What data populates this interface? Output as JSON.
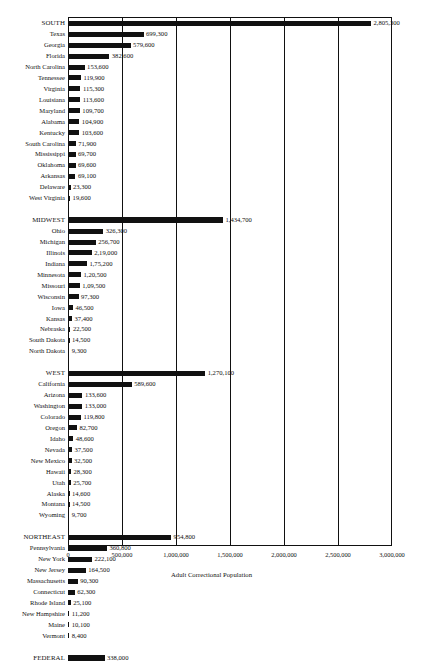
{
  "chart_data": {
    "type": "bar",
    "orientation": "horizontal",
    "title": "",
    "xlabel": "Adult Correctional Population",
    "ylabel": "",
    "xlim": [
      0,
      3000000
    ],
    "grid": true,
    "legend": null,
    "tick_labels": [
      "0",
      "500,000",
      "1,000,000",
      "1,500,000",
      "2,000,000",
      "2,500,000",
      "3,000,000"
    ],
    "tick_values": [
      0,
      500000,
      1000000,
      1500000,
      2000000,
      2500000,
      3000000
    ],
    "categories": [
      "SOUTH",
      "Texas",
      "Georgia",
      "Florida",
      "North Carolina",
      "Tennessee",
      "Virginia",
      "Louisiana",
      "Maryland",
      "Alabama",
      "Kentucky",
      "South Carolina",
      "Mississippi",
      "Oklahoma",
      "Arkansas",
      "Delaware",
      "West Virginia",
      "MIDWEST",
      "Ohio",
      "Michigan",
      "Illinois",
      "Indiana",
      "Minnesota",
      "Missouri",
      "Wisconsin",
      "Iowa",
      "Kansas",
      "Nebraska",
      "South Dakota",
      "North Dakota",
      "WEST",
      "California",
      "Arizona",
      "Washington",
      "Colorado",
      "Oregon",
      "Idaho",
      "Nevada",
      "New Mexico",
      "Hawaii",
      "Utah",
      "Alaska",
      "Montana",
      "Wyoming",
      "NORTHEAST",
      "Pennsylvania",
      "New York",
      "New Jersey",
      "Massachusetts",
      "Connecticut",
      "Rhode Island",
      "New Hampshire",
      "Maine",
      "Vermont",
      "FEDERAL"
    ],
    "values": [
      2805300,
      699300,
      579600,
      382600,
      153600,
      119900,
      115300,
      113600,
      109700,
      104900,
      103600,
      71900,
      69700,
      69600,
      69100,
      23300,
      19600,
      1434700,
      326300,
      256700,
      219000,
      175200,
      120500,
      109500,
      97300,
      46500,
      37400,
      22500,
      14500,
      9300,
      1270100,
      589600,
      133600,
      133000,
      119800,
      82700,
      48600,
      37500,
      32500,
      28300,
      25700,
      14600,
      14500,
      9700,
      954800,
      360800,
      222100,
      164500,
      90300,
      62300,
      25100,
      11200,
      10100,
      8400,
      338000
    ]
  },
  "rows": [
    {
      "label": "SOUTH",
      "value": 2805300,
      "value_label": "2,805,300",
      "region": true
    },
    {
      "label": "Texas",
      "value": 699300,
      "value_label": "699,300",
      "region": false
    },
    {
      "label": "Georgia",
      "value": 579600,
      "value_label": "579,600",
      "region": false
    },
    {
      "label": "Florida",
      "value": 382600,
      "value_label": "382,600",
      "region": false
    },
    {
      "label": "North Carolina",
      "value": 153600,
      "value_label": "153,600",
      "region": false
    },
    {
      "label": "Tennessee",
      "value": 119900,
      "value_label": "119,900",
      "region": false
    },
    {
      "label": "Virginia",
      "value": 115300,
      "value_label": "115,300",
      "region": false
    },
    {
      "label": "Louisiana",
      "value": 113600,
      "value_label": "113,600",
      "region": false
    },
    {
      "label": "Maryland",
      "value": 109700,
      "value_label": "109,700",
      "region": false
    },
    {
      "label": "Alabama",
      "value": 104900,
      "value_label": "104,900",
      "region": false
    },
    {
      "label": "Kentucky",
      "value": 103600,
      "value_label": "103,600",
      "region": false
    },
    {
      "label": "South Carolina",
      "value": 71900,
      "value_label": "71,900",
      "region": false
    },
    {
      "label": "Mississippi",
      "value": 69700,
      "value_label": "69,700",
      "region": false
    },
    {
      "label": "Oklahoma",
      "value": 69600,
      "value_label": "69,600",
      "region": false
    },
    {
      "label": "Arkansas",
      "value": 69100,
      "value_label": "69,100",
      "region": false
    },
    {
      "label": "Delaware",
      "value": 23300,
      "value_label": "23,300",
      "region": false
    },
    {
      "label": "West Virginia",
      "value": 19600,
      "value_label": "19,600",
      "region": false
    },
    {
      "spacer": true
    },
    {
      "label": "MIDWEST",
      "value": 1434700,
      "value_label": "1,434,700",
      "region": true
    },
    {
      "label": "Ohio",
      "value": 326300,
      "value_label": "326,300",
      "region": false
    },
    {
      "label": "Michigan",
      "value": 256700,
      "value_label": "256,700",
      "region": false
    },
    {
      "label": "Illinois",
      "value": 219000,
      "value_label": "2,19,000",
      "region": false
    },
    {
      "label": "Indiana",
      "value": 175200,
      "value_label": "1,75,200",
      "region": false
    },
    {
      "label": "Minnesota",
      "value": 120500,
      "value_label": "1,20,500",
      "region": false
    },
    {
      "label": "Missouri",
      "value": 109500,
      "value_label": "1,09,500",
      "region": false
    },
    {
      "label": "Wisconsin",
      "value": 97300,
      "value_label": "97,300",
      "region": false
    },
    {
      "label": "Iowa",
      "value": 46500,
      "value_label": "46,500",
      "region": false
    },
    {
      "label": "Kansas",
      "value": 37400,
      "value_label": "37,400",
      "region": false
    },
    {
      "label": "Nebraska",
      "value": 22500,
      "value_label": "22,500",
      "region": false
    },
    {
      "label": "South Dakota",
      "value": 14500,
      "value_label": "14,500",
      "region": false
    },
    {
      "label": "North Dakota",
      "value": 9300,
      "value_label": "9,300",
      "region": false
    },
    {
      "spacer": true
    },
    {
      "label": "WEST",
      "value": 1270100,
      "value_label": "1,270,100",
      "region": true
    },
    {
      "label": "California",
      "value": 589600,
      "value_label": "589,600",
      "region": false
    },
    {
      "label": "Arizona",
      "value": 133600,
      "value_label": "133,600",
      "region": false
    },
    {
      "label": "Washington",
      "value": 133000,
      "value_label": "133,000",
      "region": false
    },
    {
      "label": "Colorado",
      "value": 119800,
      "value_label": "119,800",
      "region": false
    },
    {
      "label": "Oregon",
      "value": 82700,
      "value_label": "82,700",
      "region": false
    },
    {
      "label": "Idaho",
      "value": 48600,
      "value_label": "48,600",
      "region": false
    },
    {
      "label": "Nevada",
      "value": 37500,
      "value_label": "37,500",
      "region": false
    },
    {
      "label": "New Mexico",
      "value": 32500,
      "value_label": "32,500",
      "region": false
    },
    {
      "label": "Hawaii",
      "value": 28300,
      "value_label": "28,300",
      "region": false
    },
    {
      "label": "Utah",
      "value": 25700,
      "value_label": "25,700",
      "region": false
    },
    {
      "label": "Alaska",
      "value": 14600,
      "value_label": "14,600",
      "region": false
    },
    {
      "label": "Montana",
      "value": 14500,
      "value_label": "14,500",
      "region": false
    },
    {
      "label": "Wyoming",
      "value": 9700,
      "value_label": "9,700",
      "region": false
    },
    {
      "spacer": true
    },
    {
      "label": "NORTHEAST",
      "value": 954800,
      "value_label": "954,800",
      "region": true
    },
    {
      "label": "Pennsylvania",
      "value": 360800,
      "value_label": "360,800",
      "region": false
    },
    {
      "label": "New York",
      "value": 222100,
      "value_label": "222,100",
      "region": false
    },
    {
      "label": "New Jersey",
      "value": 164500,
      "value_label": "164,500",
      "region": false
    },
    {
      "label": "Massachusetts",
      "value": 90300,
      "value_label": "90,300",
      "region": false
    },
    {
      "label": "Connecticut",
      "value": 62300,
      "value_label": "62,300",
      "region": false
    },
    {
      "label": "Rhode Island",
      "value": 25100,
      "value_label": "25,100",
      "region": false
    },
    {
      "label": "New Hampshire",
      "value": 11200,
      "value_label": "11,200",
      "region": false
    },
    {
      "label": "Maine",
      "value": 10100,
      "value_label": "10,100",
      "region": false
    },
    {
      "label": "Vermont",
      "value": 8400,
      "value_label": "8,400",
      "region": false
    },
    {
      "spacer": true
    },
    {
      "label": "FEDERAL",
      "value": 338000,
      "value_label": "338,000",
      "region": true
    }
  ]
}
